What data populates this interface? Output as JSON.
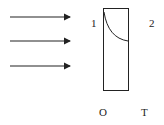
{
  "diagram": {
    "arrows": [
      {
        "y": 17
      },
      {
        "y": 41
      },
      {
        "y": 66
      }
    ],
    "labels": {
      "left_region": "1",
      "right_region": "2",
      "bottom_left": "O",
      "bottom_right": "T"
    },
    "colors": {
      "stroke": "#222222",
      "background": "#ffffff"
    }
  }
}
